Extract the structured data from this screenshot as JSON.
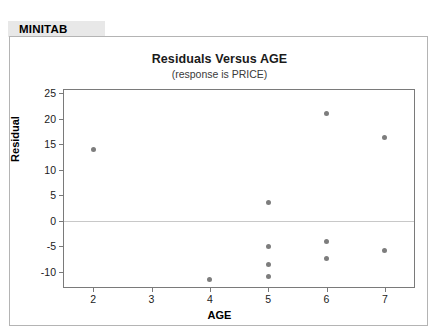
{
  "header": {
    "software_label": "MINITAB"
  },
  "chart_data": {
    "type": "scatter",
    "title": "Residuals Versus AGE",
    "subtitle": "(response is PRICE)",
    "xlabel": "AGE",
    "ylabel": "Residual",
    "xlim": [
      1.5,
      7.5
    ],
    "ylim": [
      -13.0,
      25.6
    ],
    "xticks": [
      2,
      3,
      4,
      5,
      6,
      7
    ],
    "xtick_labels": [
      "2",
      "3",
      "4",
      "5",
      "6",
      "7"
    ],
    "yticks": [
      25,
      20,
      15,
      10,
      5,
      0,
      -5,
      -10
    ],
    "ytick_labels": [
      "25",
      "20",
      "15",
      "10",
      "5",
      "0",
      "-5",
      "-10"
    ],
    "grid": false,
    "legend": "none",
    "reference_line": {
      "axis": "y",
      "value": 0,
      "color": "#c8c8c8"
    },
    "marker": {
      "shape": "circle",
      "color": "#7d7d7d",
      "size": 5
    },
    "points": [
      {
        "x": 2,
        "y": 14.0
      },
      {
        "x": 4,
        "y": -11.5
      },
      {
        "x": 5,
        "y": 3.5
      },
      {
        "x": 5,
        "y": -5.0
      },
      {
        "x": 5,
        "y": -8.5
      },
      {
        "x": 5,
        "y": -11.0
      },
      {
        "x": 6,
        "y": 21.0
      },
      {
        "x": 6,
        "y": -4.0
      },
      {
        "x": 6,
        "y": -7.5
      },
      {
        "x": 7,
        "y": 16.3
      },
      {
        "x": 7,
        "y": -5.8
      }
    ]
  }
}
